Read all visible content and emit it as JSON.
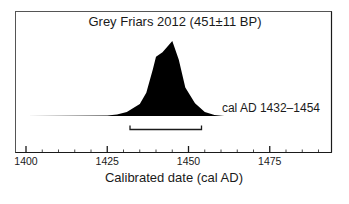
{
  "chart_data": {
    "type": "area",
    "title": "Grey Friars 2012 (451±11 BP)",
    "xlabel": "Calibrated date (cal AD)",
    "ylabel": "",
    "xlim": [
      1391,
      1497
    ],
    "x_ticks_major": [
      1400,
      1425,
      1450,
      1475
    ],
    "x_tick_labels": [
      "1400",
      "1425",
      "1450",
      "1475"
    ],
    "x_ticks_minor_step": 5,
    "grid": false,
    "legend": null,
    "annotation": "cal AD 1432–1454",
    "range": {
      "start": 1432,
      "end": 1454
    },
    "series": [
      {
        "name": "Probability distribution",
        "x": [
          1400,
          1425,
          1428,
          1431,
          1435,
          1437,
          1439,
          1440,
          1442,
          1445,
          1447,
          1449,
          1452,
          1455,
          1458,
          1461,
          1490
        ],
        "y": [
          0,
          0.007,
          0.02,
          0.055,
          0.16,
          0.31,
          0.62,
          0.79,
          0.85,
          1.0,
          0.75,
          0.38,
          0.17,
          0.055,
          0.014,
          0,
          0
        ]
      }
    ]
  },
  "colors": {
    "fill": "#000000",
    "axis": "#1a1a1a",
    "baseline": "#bfbfbf"
  }
}
